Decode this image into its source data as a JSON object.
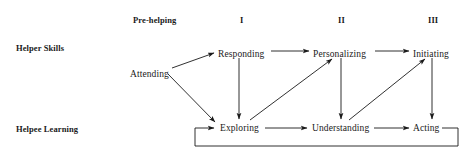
{
  "figure": {
    "type": "flow-diagram",
    "background_color": "#ffffff",
    "ink_color": "#1a1a1a"
  },
  "phase_headers": [
    {
      "id": "pre-helping",
      "label": "Pre-helping",
      "x": 133,
      "y": 16
    },
    {
      "id": "phase-1",
      "label": "I",
      "x": 240,
      "y": 16
    },
    {
      "id": "phase-2",
      "label": "II",
      "x": 338,
      "y": 16
    },
    {
      "id": "phase-3",
      "label": "III",
      "x": 428,
      "y": 16
    }
  ],
  "row_labels": [
    {
      "id": "helper-skills",
      "label": "Helper Skills",
      "x": 16,
      "y": 44
    },
    {
      "id": "helpee-learning",
      "label": "Helpee Learning",
      "x": 16,
      "y": 125
    }
  ],
  "nodes": [
    {
      "id": "attending",
      "label": "Attending",
      "row": "helper-skills",
      "phase": "pre-helping",
      "x": 130,
      "y": 70
    },
    {
      "id": "responding",
      "label": "Responding",
      "row": "helper-skills",
      "phase": "phase-1",
      "x": 218,
      "y": 50
    },
    {
      "id": "personalizing",
      "label": "Personalizing",
      "row": "helper-skills",
      "phase": "phase-2",
      "x": 313,
      "y": 50
    },
    {
      "id": "initiating",
      "label": "Initiating",
      "row": "helper-skills",
      "phase": "phase-3",
      "x": 413,
      "y": 50
    },
    {
      "id": "exploring",
      "label": "Exploring",
      "row": "helpee-learning",
      "phase": "phase-1",
      "x": 220,
      "y": 124
    },
    {
      "id": "understanding",
      "label": "Understanding",
      "row": "helpee-learning",
      "phase": "phase-2",
      "x": 312,
      "y": 124
    },
    {
      "id": "acting",
      "label": "Acting",
      "row": "helpee-learning",
      "phase": "phase-3",
      "x": 413,
      "y": 124
    }
  ],
  "edges": [
    {
      "id": "attending-to-responding",
      "from": "attending",
      "to": "responding",
      "kind": "diagonal-up"
    },
    {
      "id": "attending-to-exploring",
      "from": "attending",
      "to": "exploring",
      "kind": "diagonal-down"
    },
    {
      "id": "responding-to-personalizing",
      "from": "responding",
      "to": "personalizing",
      "kind": "horizontal"
    },
    {
      "id": "personalizing-to-initiating",
      "from": "personalizing",
      "to": "initiating",
      "kind": "horizontal"
    },
    {
      "id": "responding-to-exploring",
      "from": "responding",
      "to": "exploring",
      "kind": "vertical-down"
    },
    {
      "id": "personalizing-to-understanding",
      "from": "personalizing",
      "to": "understanding",
      "kind": "vertical-down"
    },
    {
      "id": "initiating-to-acting",
      "from": "initiating",
      "to": "acting",
      "kind": "vertical-down"
    },
    {
      "id": "exploring-to-personalizing",
      "from": "exploring",
      "to": "personalizing",
      "kind": "diagonal-up"
    },
    {
      "id": "understanding-to-initiating",
      "from": "understanding",
      "to": "initiating",
      "kind": "diagonal-up"
    },
    {
      "id": "exploring-to-understanding",
      "from": "exploring",
      "to": "understanding",
      "kind": "horizontal"
    },
    {
      "id": "understanding-to-acting",
      "from": "understanding",
      "to": "acting",
      "kind": "horizontal"
    },
    {
      "id": "acting-to-exploring-feedback",
      "from": "acting",
      "to": "exploring",
      "kind": "feedback-loop"
    }
  ]
}
